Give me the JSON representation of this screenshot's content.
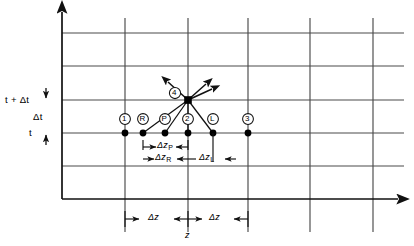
{
  "figure": {
    "type": "finite-difference-grid-diagram",
    "axes": {
      "vertical_label_upper": "t + Δt",
      "vertical_label_lower": "t",
      "vertical_step_label": "Δt",
      "horizontal_axis_label": "z",
      "vertical_axis_arrow": "up-arrow-icon",
      "horizontal_axis_arrow": "right-arrow-icon"
    },
    "grid": {
      "horizontal_lines_y": [
        33,
        66,
        100,
        133,
        166,
        199
      ],
      "vertical_lines_x": [
        62,
        125,
        188,
        248,
        310,
        373
      ],
      "axis_x": 62,
      "axis_y": 199,
      "color": "#3c3c3c"
    },
    "nodes": [
      {
        "label": "1",
        "x": 125,
        "y": 133,
        "label_x": 121,
        "label_y": 118
      },
      {
        "label": "R",
        "x": 143,
        "y": 133,
        "label_x": 139,
        "label_y": 118
      },
      {
        "label": "P",
        "x": 165,
        "y": 133,
        "label_x": 161,
        "label_y": 118
      },
      {
        "label": "2",
        "x": 188,
        "y": 133,
        "label_x": 184,
        "label_y": 118
      },
      {
        "label": "L",
        "x": 213,
        "y": 133,
        "label_x": 209,
        "label_y": 118
      },
      {
        "label": "3",
        "x": 248,
        "y": 133,
        "label_x": 244,
        "label_y": 118
      }
    ],
    "apex_node": {
      "label": "4",
      "x": 188,
      "y": 100,
      "label_x": 172,
      "label_y": 92
    },
    "characteristic_lines": [
      {
        "from": "R",
        "to": "4"
      },
      {
        "from": "P",
        "to": "4"
      },
      {
        "from": "2",
        "to": "4"
      },
      {
        "from": "L",
        "to": "4"
      }
    ],
    "apex_arrows": [
      {
        "direction": "up-left",
        "dx": -22,
        "dy": -20
      },
      {
        "direction": "up-right-steep",
        "dx": 20,
        "dy": -18
      },
      {
        "direction": "up-right-shallow",
        "dx": 26,
        "dy": -13
      }
    ],
    "measurements": [
      {
        "name": "delta-z-p",
        "base": "Δz",
        "sub": "P",
        "x1": 143,
        "x2": 188,
        "y": 146,
        "label_x": 165,
        "label_y": 142
      },
      {
        "name": "delta-z-r",
        "base": "Δz",
        "sub": "R",
        "x1": 143,
        "x2": 188,
        "y": 158,
        "label_x": 165,
        "label_y": 154
      },
      {
        "name": "delta-z-l",
        "base": "Δz",
        "sub": "L",
        "x1": 188,
        "x2": 236,
        "y": 158,
        "label_x": 210,
        "label_y": 154
      },
      {
        "name": "delta-z-left",
        "base": "Δz",
        "sub": "",
        "x1": 125,
        "x2": 188,
        "y": 219,
        "label_x": 157,
        "label_y": 215
      },
      {
        "name": "delta-z-right",
        "base": "Δz",
        "sub": "",
        "x1": 188,
        "x2": 248,
        "y": 219,
        "label_x": 218,
        "label_y": 215
      }
    ],
    "tick_marks": {
      "delta_t_top_y": 100,
      "delta_t_bottom_y": 133,
      "label": "Δt"
    }
  }
}
